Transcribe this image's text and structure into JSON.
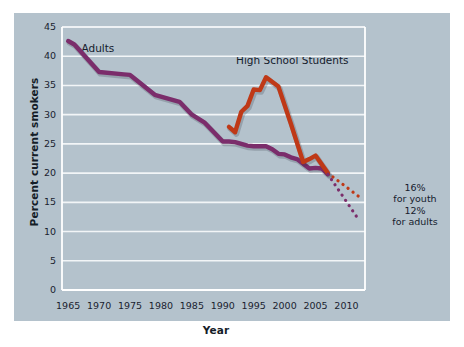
{
  "chart_data": {
    "type": "line",
    "title": "",
    "xlabel": "Year",
    "ylabel": "Percent current smokers",
    "xlim": [
      1964,
      2013
    ],
    "ylim": [
      0,
      45
    ],
    "ytick_values": [
      0,
      5,
      10,
      15,
      20,
      25,
      30,
      35,
      40,
      45
    ],
    "ytick_labels": [
      "0",
      "5",
      "10",
      "15",
      "20",
      "25",
      "30",
      "35",
      "40",
      "45"
    ],
    "xtick_values": [
      1965,
      1970,
      1975,
      1980,
      1985,
      1990,
      1995,
      2000,
      2005,
      2010
    ],
    "xtick_labels": [
      "1965",
      "1970",
      "1975",
      "1980",
      "1985",
      "1990",
      "1995",
      "2000",
      "2005",
      "2010"
    ],
    "grid": "horizontal",
    "legend_position": "inline-labels",
    "series": [
      {
        "name": "Adults",
        "color": "#7b2d6b",
        "label_x": 1972,
        "label_y": 41.2,
        "x": [
          1965,
          1966,
          1970,
          1974,
          1975,
          1979,
          1980,
          1983,
          1985,
          1987,
          1990,
          1991,
          1992,
          1993,
          1994,
          1995,
          1997,
          1998,
          1999,
          2000,
          2001,
          2002,
          2003,
          2004,
          2005,
          2006,
          2007
        ],
        "y": [
          42.6,
          42.0,
          37.3,
          36.9,
          36.8,
          33.4,
          33.1,
          32.2,
          30.0,
          28.7,
          25.4,
          25.4,
          25.3,
          25.0,
          24.7,
          24.6,
          24.6,
          24.1,
          23.3,
          23.2,
          22.7,
          22.4,
          21.6,
          20.8,
          20.9,
          20.8,
          19.8
        ]
      },
      {
        "name": "High School Students",
        "color": "#bf3917",
        "label_x": 1997,
        "label_y": 39.2,
        "x": [
          1991,
          1992,
          1993,
          1994,
          1995,
          1996,
          1997,
          1999,
          2001,
          2003,
          2004,
          2005,
          2007
        ],
        "y": [
          27.9,
          27.0,
          30.5,
          31.5,
          34.3,
          34.2,
          36.4,
          34.8,
          28.5,
          21.9,
          22.4,
          23.0,
          20.0
        ]
      }
    ],
    "projections": [
      {
        "name": "youth-projection",
        "style": "dotted",
        "color": "#bf3917",
        "x": [
          2007,
          2012
        ],
        "y": [
          20.0,
          16.0
        ]
      },
      {
        "name": "adults-projection",
        "style": "dotted",
        "color": "#7b2d6b",
        "x": [
          2007,
          2012
        ],
        "y": [
          19.8,
          12.0
        ]
      }
    ],
    "annotations": [
      {
        "id": "youth-target",
        "line1": "16%",
        "line2": "for youth",
        "x": 2013.2,
        "y": 16.5
      },
      {
        "id": "adults-target",
        "line1": "12%",
        "line2": "for adults",
        "x": 2013.2,
        "y": 12.5
      }
    ],
    "colors": {
      "panel_background": "#b4c2cc",
      "page_background": "#ffffff",
      "gridline": "#f2f5f7",
      "axis": "#ffffff",
      "adults_line": "#7b2d6b",
      "students_line": "#bf3917",
      "text": "#15202c"
    }
  }
}
